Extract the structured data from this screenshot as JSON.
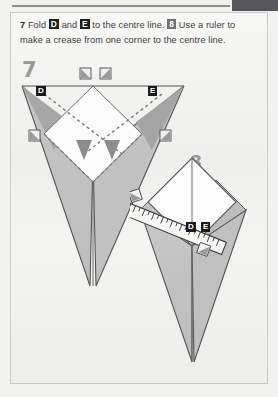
{
  "page": {
    "background_color": "#f2f2f0",
    "paper_color": "#f1f1ef",
    "border_color": "#c9c9c5"
  },
  "instructions": {
    "step7_number": "7",
    "text_part1": "Fold",
    "label_d": "D",
    "text_and": "and",
    "label_e": "E",
    "text_part2": "to the centre line.",
    "step8_number": "8",
    "text_part3": "Use a ruler to make a crease from one corner to the centre line."
  },
  "figures": [
    {
      "id": "figure-7",
      "step_number": "7",
      "description": "Folded paper kite seen from the front with two flaps D and E being folded inward to the centre line",
      "labels": [
        "D",
        "E"
      ],
      "markers": {
        "fold_arrows": 2,
        "corner_squares": 4
      },
      "colors": {
        "paper_light": "#fdfdfd",
        "paper_mid": "#c9c9c9",
        "paper_dark": "#a9a9a9",
        "paper_shadow": "#9b9b9b",
        "outline": "#4a4a4a",
        "crease": "#7d7d7d"
      }
    },
    {
      "id": "figure-8",
      "step_number": "8",
      "description": "The same kite with a ruler laid diagonally from the left corner to the centre line, crease being drawn",
      "labels": [
        "D",
        "E"
      ],
      "markers": {
        "ruler": 1,
        "corner_squares": 2
      },
      "colors": {
        "paper_light": "#fdfdfd",
        "paper_mid": "#c9c9c9",
        "paper_dark": "#a9a9a9",
        "outline": "#4a4a4a",
        "ruler_body": "#f4f4f2",
        "ruler_edge": "#3c3c3c"
      }
    }
  ],
  "corner_tab": {
    "color": "#55555a"
  }
}
